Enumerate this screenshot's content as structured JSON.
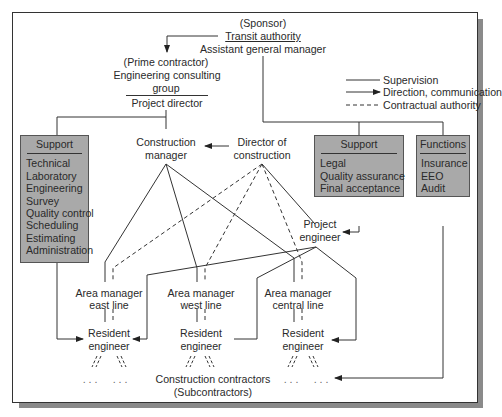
{
  "sponsor": {
    "role": "(Sponsor)",
    "org": "Transit authority",
    "title": "Assistant general manager"
  },
  "prime_contractor": {
    "role": "(Prime contractor)",
    "org_line1": "Engineering consulting",
    "org_line2": "group",
    "title": "Project director"
  },
  "legend": {
    "supervision": "Supervision",
    "direction": "Direction, communication",
    "contractual": "Contractual authority"
  },
  "support_left": {
    "header": "Support",
    "items": [
      "Technical",
      "Laboratory",
      "Engineering",
      "Survey",
      "Quality control",
      "Scheduling",
      "Estimating",
      "Administration"
    ]
  },
  "support_right": {
    "header": "Support",
    "items": [
      "Legal",
      "Quality assurance",
      "Final acceptance"
    ]
  },
  "functions": {
    "header": "Functions",
    "items": [
      "Insurance",
      "EEO",
      "Audit"
    ]
  },
  "construction_manager": {
    "line1": "Construction",
    "line2": "manager"
  },
  "director_of_construction": {
    "line1": "Director of",
    "line2": "construction"
  },
  "project_engineer": {
    "line1": "Project",
    "line2": "engineer"
  },
  "area_managers": [
    {
      "line1": "Area manager",
      "line2": "east line"
    },
    {
      "line1": "Area manager",
      "line2": "west line"
    },
    {
      "line1": "Area manager",
      "line2": "central line"
    }
  ],
  "resident_engineers": [
    {
      "line1": "Resident",
      "line2": "engineer"
    },
    {
      "line1": "Resident",
      "line2": "engineer"
    },
    {
      "line1": "Resident",
      "line2": "engineer"
    }
  ],
  "contractors": {
    "line1": "Construction contractors",
    "line2": "(Subcontractors)",
    "ellipsis": ". . ."
  },
  "colors": {
    "box_fill": "#a9a9a9",
    "line": "#333333",
    "shadow": "#8a8a8a"
  }
}
